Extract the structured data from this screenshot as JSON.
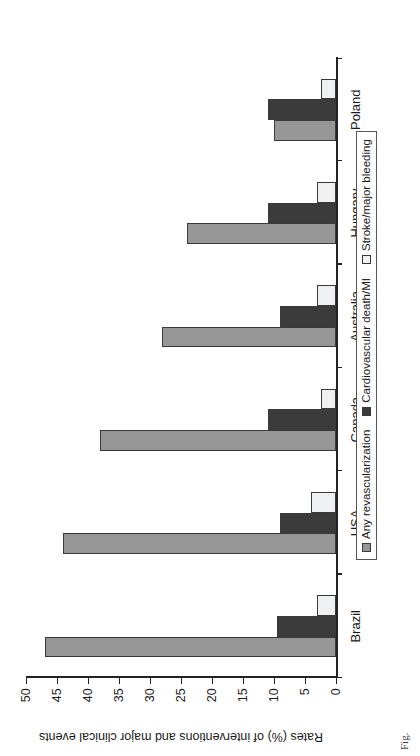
{
  "chart_data": {
    "type": "bar",
    "title": "",
    "subtitle": "",
    "orientation": "vertical",
    "categories": [
      "Brazil",
      "USA",
      "Canada",
      "Australia",
      "Hungary",
      "Poland"
    ],
    "series": [
      {
        "name": "Any revascularization",
        "color": "#969696",
        "values": [
          47,
          44,
          38,
          28,
          24,
          10
        ]
      },
      {
        "name": "Cardiovascular death/MI",
        "color": "#3b3b3b",
        "values": [
          9.5,
          9,
          11,
          9,
          11,
          11
        ]
      },
      {
        "name": "Stroke/major bleeding",
        "color": "#eff0f1",
        "values": [
          3,
          4,
          2.5,
          3,
          3,
          2.5
        ]
      }
    ],
    "xlabel": "",
    "ylabel": "Rates (%) of interventions and major clinical events",
    "ylim": [
      0,
      50
    ],
    "yticks": [
      0,
      5,
      10,
      15,
      20,
      25,
      30,
      35,
      40,
      45,
      50
    ],
    "ytick_labels": [
      "0",
      "5",
      "10",
      "15",
      "20",
      "25",
      "30",
      "35",
      "40",
      "45",
      "50"
    ],
    "grid": false,
    "legend_position": "below-axis"
  },
  "axis": {
    "y_label": "Rates (%) of interventions and major clinical events"
  },
  "legend": {
    "items": [
      {
        "label": "Any revascularization"
      },
      {
        "label": "Cardiovascular death/MI"
      },
      {
        "label": "Stroke/major bleeding"
      }
    ]
  },
  "caption": {
    "text": "Fig."
  }
}
